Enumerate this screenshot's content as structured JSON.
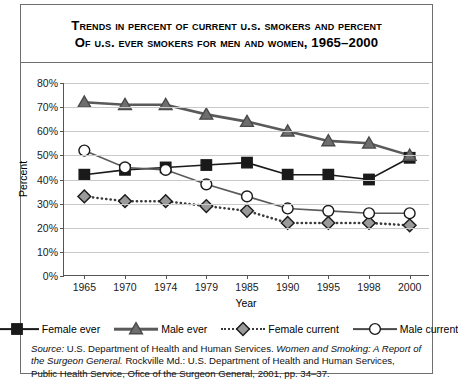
{
  "title": {
    "line1": "Trends in Percent of Current U.S. Smokers and Percent",
    "line2": "of U.S. Ever Smokers for Men and Women, 1965–2000"
  },
  "axes": {
    "ylabel": "Percent",
    "xlabel": "Year",
    "yticks": [
      "0%",
      "10%",
      "20%",
      "30%",
      "40%",
      "50%",
      "60%",
      "70%",
      "80%"
    ],
    "xticks": [
      "1965",
      "1970",
      "1974",
      "1979",
      "1985",
      "1990",
      "1995",
      "1998",
      "2000"
    ]
  },
  "legend": [
    {
      "label": "Female ever",
      "marker": "square",
      "fill": "#1a1a1a",
      "line": "solid",
      "color": "#1a1a1a"
    },
    {
      "label": "Male ever",
      "marker": "triangle",
      "fill": "#6e6e6e",
      "line": "solid",
      "color": "#5a5a5a"
    },
    {
      "label": "Female current",
      "marker": "diamond",
      "fill": "#9a9a9a",
      "line": "dotted",
      "color": "#3a3a3a"
    },
    {
      "label": "Male current",
      "marker": "circle",
      "fill": "#ffffff",
      "line": "solid",
      "color": "#4a4a4a"
    }
  ],
  "source": {
    "text_1": "Source:",
    "text_2": " U.S. Department of Health and Human Services. ",
    "text_3": "Women and Smoking: A Report of the Surgeon General.",
    "text_4": " Rockville Md.: U.S. Department of Health and Human Services,  Public Health Service, Ofice of the Surgeon General, 2001, pp. 34–37."
  },
  "chart_data": {
    "type": "line",
    "title": "Trends in Percent of Current U.S. Smokers and Percent of U.S. Ever Smokers for Men and Women, 1965–2000",
    "xlabel": "Year",
    "ylabel": "Percent",
    "categories": [
      "1965",
      "1970",
      "1974",
      "1979",
      "1985",
      "1990",
      "1995",
      "1998",
      "2000"
    ],
    "ylim": [
      0,
      80
    ],
    "ytick_step": 10,
    "grid": true,
    "legend_position": "bottom",
    "series": [
      {
        "name": "Female ever",
        "marker": "square",
        "fill": "#1a1a1a",
        "line": "solid",
        "values": [
          42,
          44,
          45,
          46,
          47,
          42,
          42,
          40,
          49
        ]
      },
      {
        "name": "Male ever",
        "marker": "triangle",
        "fill": "#6e6e6e",
        "line": "solid",
        "values": [
          72,
          71,
          71,
          67,
          64,
          60,
          56,
          55,
          50
        ]
      },
      {
        "name": "Female current",
        "marker": "diamond",
        "fill": "#9a9a9a",
        "line": "dotted",
        "values": [
          33,
          31,
          31,
          29,
          27,
          22,
          22,
          22,
          21
        ]
      },
      {
        "name": "Male current",
        "marker": "circle",
        "fill": "#ffffff",
        "line": "solid",
        "values": [
          52,
          45,
          44,
          38,
          33,
          28,
          27,
          26,
          26
        ]
      }
    ]
  }
}
